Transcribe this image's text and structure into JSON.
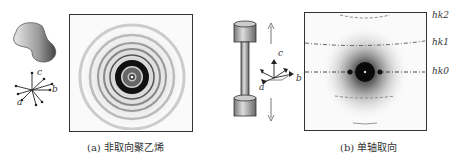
{
  "panels": [
    {
      "id": "a",
      "caption": "(a) 非取向聚乙烯",
      "axes": {
        "a": "a",
        "b": "b",
        "c": "c"
      }
    },
    {
      "id": "b",
      "caption": "(b) 单轴取向",
      "axes": {
        "a": "a",
        "b": "b",
        "c": "c"
      },
      "layer_lines": [
        "hk2",
        "hk1",
        "hk0"
      ]
    }
  ]
}
